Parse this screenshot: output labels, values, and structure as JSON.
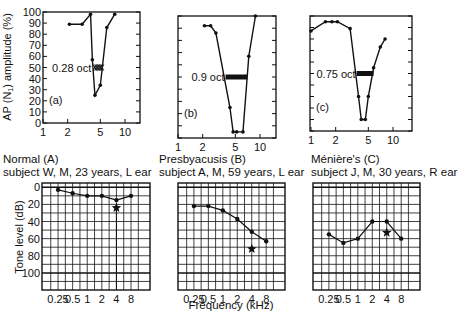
{
  "chart_data": [
    {
      "id": "a",
      "type": "line",
      "panel_label": "(a)",
      "ylabel": "AP (N1) amplitude (%)",
      "xlabel": "",
      "x_scale": "log",
      "xlim": [
        1,
        14
      ],
      "ylim": [
        0,
        100
      ],
      "x_ticks": [
        1,
        2,
        5,
        10
      ],
      "y_ticks": [
        0,
        10,
        20,
        30,
        40,
        50,
        60,
        70,
        80,
        90,
        100
      ],
      "x": [
        2.1,
        3.0,
        3.8,
        4.0,
        4.3,
        5.0,
        6.0,
        7.5
      ],
      "values": [
        89,
        89,
        98,
        57,
        25,
        34,
        86,
        98
      ],
      "annotation": {
        "text": "0.28 oct",
        "y": 50,
        "x_start": 4.1,
        "x_end": 4.9,
        "style": "hatched"
      }
    },
    {
      "id": "b",
      "type": "line",
      "panel_label": "(b)",
      "x_scale": "log",
      "xlim": [
        1,
        14
      ],
      "ylim": [
        0,
        100
      ],
      "x_ticks": [
        1,
        2,
        5,
        10
      ],
      "x": [
        2.1,
        2.5,
        2.9,
        4.3,
        4.7,
        5.2,
        6.2,
        7.3,
        8.8
      ],
      "values": [
        92,
        92,
        86,
        25,
        5,
        5,
        5,
        67,
        100
      ],
      "annotation": {
        "text": "0.9 oct",
        "y": 50,
        "x_start": 3.8,
        "x_end": 7.0,
        "style": "solid-bar"
      }
    },
    {
      "id": "c",
      "type": "line",
      "panel_label": "(c)",
      "x_scale": "log",
      "xlim": [
        1,
        14
      ],
      "ylim": [
        0,
        100
      ],
      "x_ticks": [
        1,
        2,
        5,
        10
      ],
      "x": [
        1.0,
        1.5,
        1.8,
        2.1,
        3.0,
        3.8,
        4.1,
        4.6,
        5.0,
        5.8,
        7.0,
        8.0
      ],
      "values": [
        87,
        95,
        95,
        95,
        89,
        30,
        10,
        10,
        30,
        55,
        73,
        80
      ],
      "annotation": {
        "text": "0.75 oct",
        "y": 50,
        "x_start": 3.6,
        "x_end": 5.8,
        "style": "solid-bar"
      }
    },
    {
      "id": "A",
      "type": "line",
      "title": "Normal (A)",
      "subtitle": "subject W, M, 23 years, L ear",
      "ylabel": "Tone level (dB)",
      "xlabel": "",
      "categories": [
        "0.25",
        "0.5",
        "1",
        "2",
        "4",
        "8"
      ],
      "values": [
        3,
        7,
        10,
        10,
        15,
        10
      ],
      "star": {
        "category": "4",
        "value": 24
      },
      "y_ticks": [
        0,
        20,
        40,
        60,
        80,
        100
      ],
      "ylim": [
        -5,
        120
      ],
      "y_inverted": true,
      "grid": true
    },
    {
      "id": "B",
      "type": "line",
      "title": "Presbyacusis (B)",
      "subtitle": "subject A, M, 59 years, L ear",
      "xlabel": "Frequency (kHz)",
      "categories": [
        "0.25",
        "0.5",
        "1",
        "2",
        "4",
        "8"
      ],
      "values": [
        22,
        22,
        27,
        37,
        52,
        63
      ],
      "star": {
        "category": "4",
        "value": 72
      },
      "ylim": [
        -5,
        120
      ],
      "y_inverted": true,
      "grid": true
    },
    {
      "id": "C",
      "type": "line",
      "title": "Ménière's (C)",
      "subtitle": "subject J, M, 30 years, R ear",
      "categories": [
        "0.25",
        "0.5",
        "1",
        "2",
        "4",
        "8"
      ],
      "values": [
        55,
        65,
        60,
        40,
        40,
        60
      ],
      "star": {
        "category": "4",
        "value": 53
      },
      "ylim": [
        -5,
        120
      ],
      "y_inverted": true,
      "grid": true
    }
  ],
  "text": {
    "top_ylabel": "AP (N",
    "top_ylabel_sub": "1",
    "top_ylabel_rest": ") amplitude (%)",
    "bottom_ylabel": "Tone level (dB)",
    "bottom_xlabel": "Frequency (kHz)",
    "title_A": "Normal (A)",
    "subtitle_A": "subject W, M, 23 years, L ear",
    "title_B": "Presbyacusis (B)",
    "subtitle_B": "subject A, M, 59 years, L ear",
    "title_C": "Ménière's (C)",
    "subtitle_C": "subject J, M, 30 years, R ear"
  }
}
